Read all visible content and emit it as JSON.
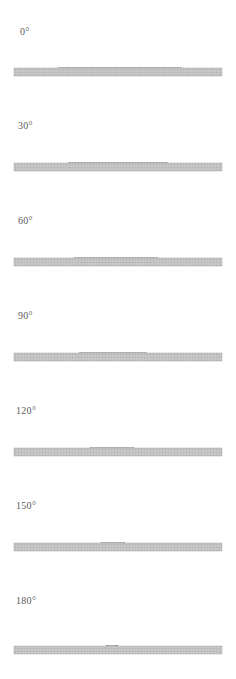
{
  "figure": {
    "background_color": "#ffffff",
    "width": 236,
    "height": 679,
    "droplet_fill": "#5c5c5c",
    "droplet_edge": "#3f3f3f",
    "droplet_speckle_light": "#8d8d8d",
    "substrate_fill": "#c9c9c9",
    "substrate_grid": "#a8a8a8",
    "label_color": "#5a5a5a"
  },
  "chart_data": {
    "type": "diagram-series",
    "xlabel": "",
    "ylabel": "",
    "quantity": "contact angle",
    "unit": "degrees",
    "categories": [
      "0°",
      "30°",
      "60°",
      "90°",
      "120°",
      "150°",
      "180°"
    ],
    "values": [
      0,
      30,
      60,
      90,
      120,
      150,
      180
    ],
    "series": [
      {
        "name": "contact width (px)",
        "values": [
          124,
          100,
          84,
          68,
          44,
          24,
          12
        ]
      },
      {
        "name": "droplet height (px)",
        "values": [
          30,
          38,
          48,
          56,
          64,
          70,
          72
        ]
      }
    ]
  },
  "panels": [
    {
      "id": "panel-0",
      "label": "0°",
      "angle": 0,
      "label_x": 20,
      "label_y": 27,
      "top": 0,
      "height": 95,
      "baseline": 68,
      "substrate_top": 68,
      "substrate_height": 8,
      "droplet": {
        "center_x": 120,
        "contact_half_width": 62,
        "height": 30,
        "shape": "flat-spherical-cap"
      }
    },
    {
      "id": "panel-30",
      "label": "30°",
      "angle": 30,
      "label_x": 18,
      "label_y": 121,
      "top": 95,
      "height": 95,
      "baseline": 163,
      "substrate_top": 163,
      "substrate_height": 8,
      "droplet": {
        "center_x": 118,
        "contact_half_width": 50,
        "height": 38,
        "shape": "spherical-cap"
      }
    },
    {
      "id": "panel-60",
      "label": "60°",
      "angle": 60,
      "label_x": 18,
      "label_y": 216,
      "top": 190,
      "height": 95,
      "baseline": 258,
      "substrate_top": 258,
      "substrate_height": 8,
      "droplet": {
        "center_x": 116,
        "contact_half_width": 42,
        "height": 48,
        "shape": "spherical-cap"
      }
    },
    {
      "id": "panel-90",
      "label": "90°",
      "angle": 90,
      "label_x": 18,
      "label_y": 311,
      "top": 285,
      "height": 95,
      "baseline": 353,
      "substrate_top": 353,
      "substrate_height": 8,
      "droplet": {
        "center_x": 113,
        "contact_half_width": 34,
        "height": 56,
        "shape": "hemispherical-dome"
      }
    },
    {
      "id": "panel-120",
      "label": "120°",
      "angle": 120,
      "label_x": 16,
      "label_y": 406,
      "top": 380,
      "height": 95,
      "baseline": 448,
      "substrate_top": 448,
      "substrate_height": 8,
      "droplet": {
        "center_x": 112,
        "contact_half_width": 22,
        "height": 64,
        "shape": "truncated-sphere"
      }
    },
    {
      "id": "panel-150",
      "label": "150°",
      "angle": 150,
      "label_x": 16,
      "label_y": 501,
      "top": 475,
      "height": 95,
      "baseline": 543,
      "substrate_top": 543,
      "substrate_height": 8,
      "droplet": {
        "center_x": 113,
        "contact_half_width": 12,
        "height": 70,
        "shape": "near-spherical"
      }
    },
    {
      "id": "panel-180",
      "label": "180°",
      "angle": 180,
      "label_x": 16,
      "label_y": 596,
      "top": 570,
      "height": 109,
      "baseline": 646,
      "substrate_top": 646,
      "substrate_height": 8,
      "droplet": {
        "center_x": 112,
        "contact_half_width": 6,
        "height": 72,
        "shape": "spherical"
      }
    }
  ],
  "substrate": {
    "left": 14,
    "right": 222,
    "label": "textured solid substrate"
  }
}
